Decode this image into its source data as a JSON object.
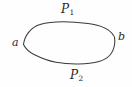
{
  "figure": {
    "type": "closed-curve-diagram",
    "background_color": "#fefefe",
    "stroke_color": "#3a3a3a",
    "stroke_width": 1,
    "labels": {
      "upper_path": {
        "base": "P",
        "subscript": "1",
        "text": "P1"
      },
      "lower_path": {
        "base": "P",
        "subscript": "2",
        "text": "P2"
      },
      "left_point": "a",
      "right_point": "b"
    }
  }
}
